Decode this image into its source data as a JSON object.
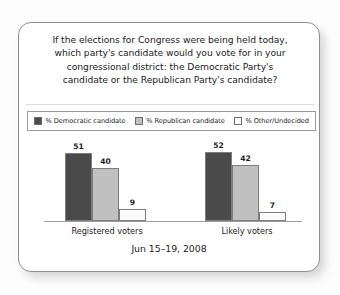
{
  "card": {
    "title_lines": [
      "If the elections for Congress were being held today,",
      "which party's candidate would you vote for in your",
      "congressional district: the Democratic Party's",
      "candidate or the Republican Party's candidate?"
    ],
    "footer": "Jun 15–19, 2008"
  },
  "legend": {
    "items": [
      {
        "label": "% Democratic candidate",
        "color": "#4a4a4a"
      },
      {
        "label": "% Republican candidate",
        "color": "#c0c0c0"
      },
      {
        "label": "% Other/Undecided",
        "color": "#fbfbfb"
      }
    ]
  },
  "chart_data": {
    "type": "bar",
    "subtitle": "Jun 15–19, 2008",
    "xlabel": "",
    "ylabel": "",
    "ylim": [
      0,
      60
    ],
    "grid": false,
    "legend_position": "top",
    "categories": [
      "Registered voters",
      "Likely voters"
    ],
    "series": [
      {
        "name": "% Democratic candidate",
        "color": "#4a4a4a",
        "values": [
          51,
          40
        ]
      },
      {
        "name": "% Republican candidate",
        "color": "#c0c0c0",
        "values": [
          40,
          42
        ]
      },
      {
        "name": "% Other/Undecided",
        "color": "#fbfbfb",
        "values": [
          9,
          7
        ]
      }
    ],
    "groups": [
      {
        "category": "Registered voters",
        "bars": [
          {
            "series": "% Democratic candidate",
            "value": 51,
            "label": "51",
            "color": "#4a4a4a"
          },
          {
            "series": "% Republican candidate",
            "value": 40,
            "label": "40",
            "color": "#c0c0c0"
          },
          {
            "series": "% Other/Undecided",
            "value": 9,
            "label": "9",
            "color": "#fbfbfb"
          }
        ]
      },
      {
        "category": "Likely voters",
        "bars": [
          {
            "series": "% Democratic candidate",
            "value": 52,
            "label": "52",
            "color": "#4a4a4a"
          },
          {
            "series": "% Republican candidate",
            "value": 42,
            "label": "42",
            "color": "#c0c0c0"
          },
          {
            "series": "% Other/Undecided",
            "value": 7,
            "label": "7",
            "color": "#fbfbfb"
          }
        ]
      }
    ]
  }
}
